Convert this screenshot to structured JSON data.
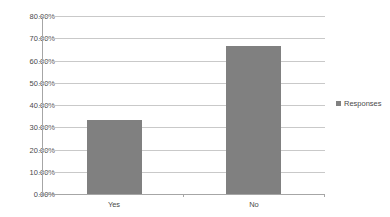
{
  "chart_data": {
    "type": "bar",
    "title": "",
    "xlabel": "",
    "ylabel": "",
    "categories": [
      "Yes",
      "No"
    ],
    "values": [
      33.33,
      66.67
    ],
    "series": [
      {
        "name": "Responses",
        "values": [
          33.33,
          66.67
        ]
      }
    ],
    "ylim": [
      0,
      80
    ],
    "ytick_values": [
      0,
      10,
      20,
      30,
      40,
      50,
      60,
      70,
      80
    ],
    "ytick_labels": [
      "0.00%",
      "10.00%",
      "20.00%",
      "30.00%",
      "40.00%",
      "50.00%",
      "60.00%",
      "70.00%",
      "80.00%"
    ],
    "value_format": "percent",
    "grid": true,
    "grid_axis": "y",
    "legend": [
      "Responses"
    ],
    "legend_position": "right",
    "bar_color": "#808080",
    "gridline_color": "#c9c9c9",
    "axis_color": "#a6a6a6",
    "text_color": "#4a4a4a",
    "background_color": "#ffffff"
  }
}
